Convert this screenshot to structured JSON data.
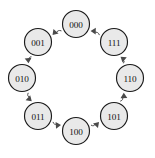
{
  "figure": {
    "background_color": "#ffffff",
    "node_fill_color": "#e9e9e9",
    "node_stroke_color": "#1a1a1a",
    "edge_color": "#4a4a4a",
    "label_color": "#111111"
  },
  "chart_data": {
    "type": "diagram",
    "subtype": "directed-cycle-graph",
    "title": "",
    "xlabel": "",
    "ylabel": "",
    "legend": [],
    "grid": false,
    "layout": {
      "shape": "circle",
      "center_x": 76,
      "center_y": 78,
      "radius": 54,
      "node_radius": 13.5,
      "direction": "counterclockwise",
      "start_angle_deg": 90
    },
    "nodes": [
      {
        "id": "n0",
        "label": "000",
        "cx": 76,
        "cy": 24,
        "angle_deg": 90
      },
      {
        "id": "n1",
        "label": "001",
        "cx": 38,
        "cy": 42,
        "angle_deg": 135
      },
      {
        "id": "n2",
        "label": "010",
        "cx": 22,
        "cy": 78,
        "angle_deg": 180
      },
      {
        "id": "n3",
        "label": "011",
        "cx": 38,
        "cy": 116,
        "angle_deg": 225
      },
      {
        "id": "n4",
        "label": "100",
        "cx": 76,
        "cy": 131,
        "angle_deg": 270
      },
      {
        "id": "n5",
        "label": "101",
        "cx": 114,
        "cy": 116,
        "angle_deg": 315
      },
      {
        "id": "n6",
        "label": "110",
        "cx": 130,
        "cy": 78,
        "angle_deg": 0
      },
      {
        "id": "n7",
        "label": "111",
        "cx": 114,
        "cy": 42,
        "angle_deg": 45
      }
    ],
    "edges": [
      {
        "from": "000",
        "to": "001",
        "directed": true
      },
      {
        "from": "001",
        "to": "010",
        "directed": true
      },
      {
        "from": "010",
        "to": "011",
        "directed": true
      },
      {
        "from": "011",
        "to": "100",
        "directed": true
      },
      {
        "from": "100",
        "to": "101",
        "directed": true
      },
      {
        "from": "101",
        "to": "110",
        "directed": true
      },
      {
        "from": "110",
        "to": "111",
        "directed": true
      },
      {
        "from": "111",
        "to": "000",
        "directed": true
      }
    ],
    "node_labels": [
      "000",
      "001",
      "010",
      "011",
      "100",
      "101",
      "110",
      "111"
    ],
    "annotations": []
  }
}
